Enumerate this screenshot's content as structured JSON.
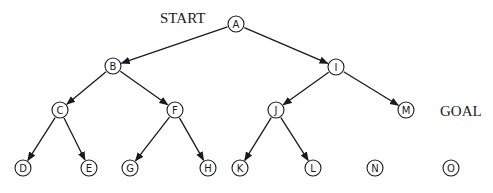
{
  "diagram": {
    "type": "tree",
    "annotations": [
      {
        "id": "start",
        "text": "START",
        "x": 160,
        "y": 23
      },
      {
        "id": "goal",
        "text": "GOAL",
        "x": 440,
        "y": 116
      }
    ],
    "nodes": [
      {
        "id": "A",
        "label": "A",
        "x": 236,
        "y": 24
      },
      {
        "id": "B",
        "label": "B",
        "x": 113,
        "y": 66
      },
      {
        "id": "I",
        "label": "I",
        "x": 336,
        "y": 67
      },
      {
        "id": "C",
        "label": "C",
        "x": 60,
        "y": 110
      },
      {
        "id": "F",
        "label": "F",
        "x": 175,
        "y": 110
      },
      {
        "id": "J",
        "label": "J",
        "x": 276,
        "y": 110
      },
      {
        "id": "M",
        "label": "M",
        "x": 406,
        "y": 110
      },
      {
        "id": "D",
        "label": "D",
        "x": 23,
        "y": 168
      },
      {
        "id": "E",
        "label": "E",
        "x": 89,
        "y": 168
      },
      {
        "id": "G",
        "label": "G",
        "x": 130,
        "y": 168
      },
      {
        "id": "H",
        "label": "H",
        "x": 208,
        "y": 168
      },
      {
        "id": "K",
        "label": "K",
        "x": 240,
        "y": 168
      },
      {
        "id": "L",
        "label": "L",
        "x": 313,
        "y": 168
      },
      {
        "id": "N",
        "label": "N",
        "x": 375,
        "y": 168
      },
      {
        "id": "O",
        "label": "O",
        "x": 451,
        "y": 168
      }
    ],
    "edges": [
      {
        "from": "A",
        "to": "B"
      },
      {
        "from": "A",
        "to": "I"
      },
      {
        "from": "B",
        "to": "C"
      },
      {
        "from": "B",
        "to": "F"
      },
      {
        "from": "I",
        "to": "J"
      },
      {
        "from": "I",
        "to": "M"
      },
      {
        "from": "C",
        "to": "D"
      },
      {
        "from": "C",
        "to": "E"
      },
      {
        "from": "F",
        "to": "G"
      },
      {
        "from": "F",
        "to": "H"
      },
      {
        "from": "J",
        "to": "K"
      },
      {
        "from": "J",
        "to": "L"
      }
    ],
    "node_radius": 8,
    "colors": {
      "stroke": "#1a1a1a",
      "background": "#ffffff"
    }
  }
}
